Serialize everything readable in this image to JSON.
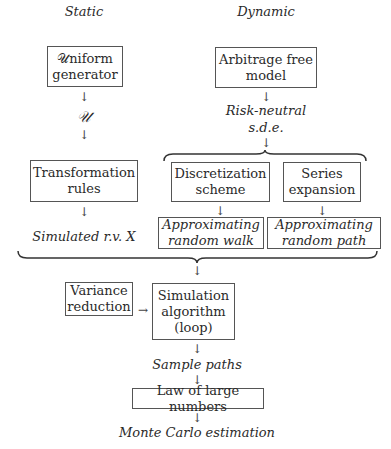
{
  "columns": {
    "static": "Static",
    "dynamic": "Dynamic"
  },
  "static_branch": {
    "uniform_generator": [
      "𝒰niform",
      "generator"
    ],
    "uniform_symbol": "𝒰",
    "transformation_rules": [
      "Transformation",
      "rules"
    ],
    "simulated_rv": "Simulated r.v. X"
  },
  "dynamic_branch": {
    "arbitrage_free_model": [
      "Arbitrage free",
      "model"
    ],
    "risk_neutral_sde": [
      "Risk-neutral",
      "s.d.e."
    ],
    "discretization_scheme": [
      "Discretization",
      "scheme"
    ],
    "series_expansion": [
      "Series",
      "expansion"
    ],
    "approx_random_walk": [
      "Approximating",
      "random walk"
    ],
    "approx_random_path": [
      "Approximating",
      "random path"
    ]
  },
  "merge": {
    "variance_reduction": [
      "Variance",
      "reduction"
    ],
    "simulation_algorithm": [
      "Simulation",
      "algorithm",
      "(loop)"
    ],
    "sample_paths": "Sample paths",
    "law_of_large_numbers": "Law of large numbers",
    "monte_carlo_estimation": "Monte Carlo estimation"
  },
  "arrow_glyphs": {
    "down": "↓",
    "right": "→"
  }
}
